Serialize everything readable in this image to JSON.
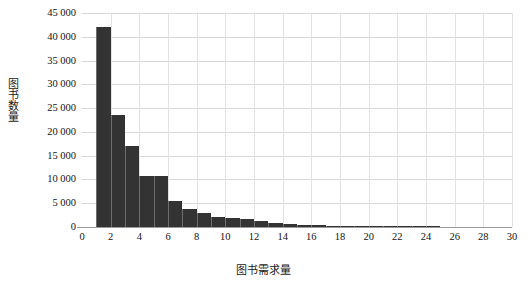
{
  "chart_data": {
    "type": "bar",
    "title": "",
    "xlabel": "图书需求量",
    "ylabel": "图书数量",
    "xlim": [
      0,
      30
    ],
    "ylim": [
      0,
      45000
    ],
    "grid": true,
    "legend": "none",
    "x_tick_labels": [
      "0",
      "2",
      "4",
      "6",
      "8",
      "10",
      "12",
      "14",
      "16",
      "18",
      "20",
      "22",
      "24",
      "26",
      "28",
      "30"
    ],
    "x_tick_values": [
      0,
      2,
      4,
      6,
      8,
      10,
      12,
      14,
      16,
      18,
      20,
      22,
      24,
      26,
      28,
      30
    ],
    "y_tick_labels": [
      "0",
      "5 000",
      "10 000",
      "15 000",
      "20 000",
      "25 000",
      "30 000",
      "35 000",
      "40 000",
      "45 000"
    ],
    "y_tick_values": [
      0,
      5000,
      10000,
      15000,
      20000,
      25000,
      30000,
      35000,
      40000,
      45000
    ],
    "bar_color": "#333333",
    "bin_width": 1,
    "categories": [
      1,
      2,
      3,
      4,
      5,
      6,
      7,
      8,
      9,
      10,
      11,
      12,
      13,
      14,
      15,
      16,
      17,
      18,
      19,
      20,
      21,
      22,
      23,
      24,
      25,
      26,
      27,
      28,
      29,
      30
    ],
    "values": [
      42000,
      23500,
      17000,
      10800,
      10700,
      5400,
      3700,
      2900,
      2200,
      1900,
      1700,
      1200,
      900,
      700,
      500,
      400,
      300,
      200,
      150,
      100,
      60,
      40,
      120,
      30,
      0,
      0,
      0,
      0,
      0,
      0
    ]
  }
}
